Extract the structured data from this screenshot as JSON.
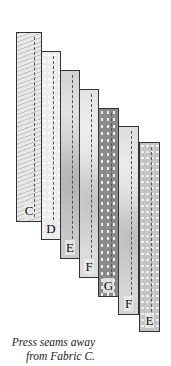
{
  "diagram": {
    "strips": [
      {
        "label": "C",
        "left": 16,
        "top": 32,
        "width": 26,
        "height": 190,
        "fill": "#e8e8e8",
        "pattern": "fern",
        "seam_x": 17
      },
      {
        "label": "D",
        "left": 41,
        "top": 51,
        "width": 20,
        "height": 189,
        "fill": "#ececec",
        "pattern": "dots",
        "seam_x": 11
      },
      {
        "label": "E",
        "left": 60,
        "top": 70,
        "width": 20,
        "height": 189,
        "fill": "#c8c8c8",
        "pattern": "mottled",
        "seam_x": 11
      },
      {
        "label": "F",
        "left": 79,
        "top": 89,
        "width": 20,
        "height": 189,
        "fill": "#dcdcdc",
        "pattern": "mottled",
        "seam_x": 11
      },
      {
        "label": "G",
        "left": 98,
        "top": 108,
        "width": 21,
        "height": 189,
        "fill": "#8a8a8a",
        "pattern": "speckle",
        "seam_x": 12
      },
      {
        "label": "F",
        "left": 118,
        "top": 126,
        "width": 21,
        "height": 189,
        "fill": "#d6d6d6",
        "pattern": "mottled",
        "seam_x": 12
      },
      {
        "label": "E",
        "left": 139,
        "top": 142,
        "width": 21,
        "height": 190,
        "fill": "#c4c4c4",
        "pattern": "dots",
        "seam_x": 11
      }
    ],
    "caption": {
      "line1": "Press seams away",
      "line2": "from Fabric C."
    }
  }
}
